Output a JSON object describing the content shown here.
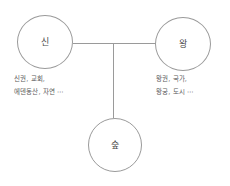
{
  "diagram": {
    "type": "concept-relation-diagram",
    "background_color": "#ffffff",
    "stroke_color": "#9a9a9a",
    "text_color": "#5a5a5a",
    "nodes": [
      {
        "id": "god",
        "label": "신",
        "position": "left"
      },
      {
        "id": "king",
        "label": "왕",
        "position": "right"
      },
      {
        "id": "forest",
        "label": "숲",
        "position": "bottom"
      }
    ],
    "captions": {
      "god": {
        "line1": "신권, 교회,",
        "line2": "에덴동산, 자연 ⋯"
      },
      "king": {
        "line1": "왕권, 국가,",
        "line2": "왕궁, 도시 ⋯"
      }
    },
    "connectors": [
      {
        "from": "god",
        "to": "junction",
        "orientation": "horizontal"
      },
      {
        "from": "junction",
        "to": "king",
        "orientation": "horizontal"
      },
      {
        "from": "junction",
        "to": "forest",
        "orientation": "vertical"
      }
    ]
  }
}
